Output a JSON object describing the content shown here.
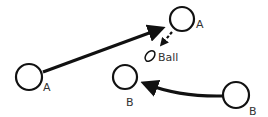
{
  "diagram": {
    "nodes": [
      {
        "id": "a1",
        "label": "A",
        "cx": 29,
        "cy": 77,
        "r": 13
      },
      {
        "id": "a2",
        "label": "A",
        "cx": 182,
        "cy": 19,
        "r": 12
      },
      {
        "id": "b1",
        "label": "B",
        "cx": 125,
        "cy": 77,
        "r": 12
      },
      {
        "id": "b2",
        "label": "B",
        "cx": 236,
        "cy": 95,
        "r": 13
      }
    ],
    "ball": {
      "label": "Ball"
    },
    "colors": {
      "stroke": "#111111",
      "text": "#333333"
    }
  }
}
